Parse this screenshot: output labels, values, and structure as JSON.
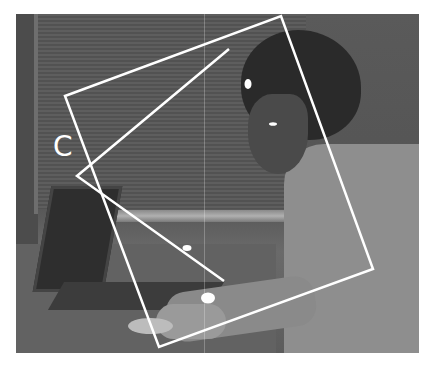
{
  "figure": {
    "label": "C",
    "overlay_color": "#ffffff",
    "photo_tone": "grayscale",
    "scene": "man wearing head-mounted eye-tracking apparatus using a laptop and mouse at a desk",
    "shapes": {
      "rectangle": [
        [
          65,
          96
        ],
        [
          281,
          16
        ],
        [
          373,
          269
        ],
        [
          159,
          347
        ]
      ],
      "triangle": [
        [
          229,
          49
        ],
        [
          77,
          176
        ],
        [
          224,
          281
        ]
      ],
      "markers": [
        {
          "name": "eye-marker",
          "cx": 248,
          "cy": 84,
          "rx": 3.5,
          "ry": 5
        },
        {
          "name": "cheek-marker",
          "cx": 273,
          "cy": 124,
          "rx": 4,
          "ry": 1.8
        },
        {
          "name": "keyboard-marker",
          "cx": 187,
          "cy": 248,
          "rx": 4.5,
          "ry": 3
        },
        {
          "name": "hand-marker",
          "cx": 208,
          "cy": 298,
          "rx": 7,
          "ry": 5.5
        }
      ]
    }
  }
}
